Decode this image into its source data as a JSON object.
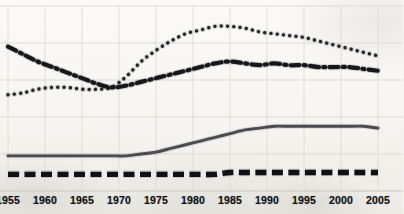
{
  "chart_data": {
    "type": "line",
    "title": "",
    "subtitle": "",
    "xlabel": "",
    "ylabel": "",
    "xlim": [
      1955,
      2005
    ],
    "ylim": [
      0,
      100
    ],
    "grid": true,
    "grid_x_values": [
      1955,
      1960,
      1965,
      1970,
      1975,
      1980,
      1985,
      1990,
      1995,
      2000,
      2005
    ],
    "grid_y_values": [
      0,
      20,
      40,
      60,
      80,
      100
    ],
    "legend_position": "none",
    "x_tick_labels": [
      "1955",
      "1960",
      "1965",
      "1970",
      "1975",
      "1980",
      "1985",
      "1990",
      "1995",
      "2000",
      "2005"
    ],
    "x": [
      1955,
      1957,
      1959,
      1961,
      1963,
      1965,
      1967,
      1969,
      1971,
      1973,
      1975,
      1977,
      1979,
      1981,
      1983,
      1985,
      1987,
      1989,
      1991,
      1993,
      1995,
      1997,
      1999,
      2001,
      2003,
      2005
    ],
    "series": [
      {
        "name": "series-dotted",
        "style": "dotted",
        "color": "#232428",
        "values": [
          52,
          53,
          55,
          56,
          56,
          55,
          55,
          56,
          62,
          70,
          76,
          81,
          85,
          87,
          89,
          89,
          88,
          86,
          85,
          84,
          83,
          81,
          79,
          77,
          75,
          73
        ]
      },
      {
        "name": "series-dash-dot",
        "style": "dash-dot",
        "color": "#16171b",
        "values": [
          78,
          74,
          70,
          67,
          64,
          61,
          58,
          56,
          57,
          59,
          61,
          63,
          65,
          67,
          69,
          70,
          69,
          68,
          69,
          68,
          68,
          67,
          67,
          67,
          66,
          65
        ]
      },
      {
        "name": "series-solid",
        "style": "solid",
        "color": "#4a4b4e",
        "values": [
          19,
          19,
          19,
          19,
          19,
          19,
          19,
          19,
          19,
          20,
          21,
          23,
          25,
          27,
          29,
          31,
          33,
          34,
          35,
          35,
          35,
          35,
          35,
          35,
          35,
          34
        ]
      },
      {
        "name": "series-dashed-bold",
        "style": "dashed-bold",
        "color": "#101114",
        "values": [
          9,
          9,
          9,
          9,
          9,
          9,
          9,
          9,
          9,
          9,
          9,
          9,
          9,
          9,
          9,
          10,
          10,
          10,
          10,
          10,
          10,
          10,
          10,
          10,
          10,
          10
        ]
      }
    ]
  }
}
